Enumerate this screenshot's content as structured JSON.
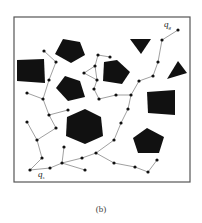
{
  "figure": {
    "caption": "(b)",
    "frame": {
      "x": 14,
      "y": 17,
      "w": 176,
      "h": 165,
      "stroke": "#555555"
    },
    "colors": {
      "obstacle": "#111111",
      "edge": "#777777",
      "node": "#111111",
      "background": "#ffffff"
    },
    "labels": {
      "start": {
        "text": "q",
        "sub": "s",
        "x": 38,
        "y": 177
      },
      "goal": {
        "text": "q",
        "sub": "g",
        "x": 164,
        "y": 27
      }
    },
    "obstacles": [
      {
        "name": "pentagon-top-left",
        "points": "63,39 80,42 85,55 71,63 55,54"
      },
      {
        "name": "square-left",
        "points": "17,60 44,59 45,83 17,81"
      },
      {
        "name": "pentagon-mid-left",
        "points": "65,76 80,81 85,97 68,101 56,88"
      },
      {
        "name": "pentagon-center",
        "points": "104,62 117,60 130,72 122,84 103,81"
      },
      {
        "name": "triangle-top-right",
        "points": "130,39 151,39 141,54"
      },
      {
        "name": "triangle-right",
        "points": "178,61 187,73 167,79"
      },
      {
        "name": "square-right",
        "points": "147,92 175,90 175,115 148,113"
      },
      {
        "name": "hexagon-center",
        "points": "85,109 101,117 103,136 85,144 66,136 67,117"
      },
      {
        "name": "pentagon-bottom-right",
        "points": "147,128 164,137 159,153 138,153 133,138"
      }
    ],
    "nodes": [
      {
        "id": "qs",
        "x": 30,
        "y": 170
      },
      {
        "id": "n1",
        "x": 50,
        "y": 168
      },
      {
        "id": "n2",
        "x": 62,
        "y": 163
      },
      {
        "id": "n3",
        "x": 64,
        "y": 147
      },
      {
        "id": "n4",
        "x": 85,
        "y": 170
      },
      {
        "id": "n5",
        "x": 82,
        "y": 158
      },
      {
        "id": "n6",
        "x": 96,
        "y": 153
      },
      {
        "id": "n7",
        "x": 114,
        "y": 163
      },
      {
        "id": "n8",
        "x": 135,
        "y": 167
      },
      {
        "id": "n9",
        "x": 148,
        "y": 172
      },
      {
        "id": "n10",
        "x": 157,
        "y": 160
      },
      {
        "id": "n11",
        "x": 114,
        "y": 140
      },
      {
        "id": "n12",
        "x": 121,
        "y": 123
      },
      {
        "id": "n13",
        "x": 128,
        "y": 109
      },
      {
        "id": "n14",
        "x": 131,
        "y": 95
      },
      {
        "id": "n15",
        "x": 116,
        "y": 95
      },
      {
        "id": "n16",
        "x": 99,
        "y": 99
      },
      {
        "id": "n17",
        "x": 94,
        "y": 89
      },
      {
        "id": "n18",
        "x": 97,
        "y": 80
      },
      {
        "id": "n19",
        "x": 84,
        "y": 73
      },
      {
        "id": "n20",
        "x": 95,
        "y": 66
      },
      {
        "id": "n21",
        "x": 98,
        "y": 55
      },
      {
        "id": "n22",
        "x": 110,
        "y": 57
      },
      {
        "id": "n23",
        "x": 139,
        "y": 81
      },
      {
        "id": "n24",
        "x": 153,
        "y": 76
      },
      {
        "id": "n25",
        "x": 158,
        "y": 62
      },
      {
        "id": "n26",
        "x": 162,
        "y": 40
      },
      {
        "id": "qg",
        "x": 178,
        "y": 30
      },
      {
        "id": "n27",
        "x": 42,
        "y": 158
      },
      {
        "id": "n28",
        "x": 37,
        "y": 140
      },
      {
        "id": "n29",
        "x": 27,
        "y": 122
      },
      {
        "id": "n30",
        "x": 56,
        "y": 128
      },
      {
        "id": "n31",
        "x": 49,
        "y": 115
      },
      {
        "id": "n32",
        "x": 68,
        "y": 110
      },
      {
        "id": "n33",
        "x": 43,
        "y": 99
      },
      {
        "id": "n34",
        "x": 27,
        "y": 93
      },
      {
        "id": "n35",
        "x": 49,
        "y": 80
      },
      {
        "id": "n36",
        "x": 56,
        "y": 62
      },
      {
        "id": "n37",
        "x": 44,
        "y": 51
      }
    ],
    "edges": [
      [
        "qs",
        "n1"
      ],
      [
        "n1",
        "n2"
      ],
      [
        "n2",
        "n3"
      ],
      [
        "n2",
        "n4"
      ],
      [
        "n2",
        "n5"
      ],
      [
        "n5",
        "n6"
      ],
      [
        "n6",
        "n7"
      ],
      [
        "n7",
        "n8"
      ],
      [
        "n8",
        "n9"
      ],
      [
        "n9",
        "n10"
      ],
      [
        "n6",
        "n11"
      ],
      [
        "n11",
        "n12"
      ],
      [
        "n12",
        "n13"
      ],
      [
        "n13",
        "n14"
      ],
      [
        "n14",
        "n15"
      ],
      [
        "n15",
        "n16"
      ],
      [
        "n16",
        "n17"
      ],
      [
        "n17",
        "n18"
      ],
      [
        "n18",
        "n19"
      ],
      [
        "n19",
        "n20"
      ],
      [
        "n18",
        "n20"
      ],
      [
        "n20",
        "n21"
      ],
      [
        "n21",
        "n22"
      ],
      [
        "n14",
        "n23"
      ],
      [
        "n23",
        "n24"
      ],
      [
        "n24",
        "n25"
      ],
      [
        "n25",
        "n26"
      ],
      [
        "n26",
        "qg"
      ],
      [
        "qs",
        "n27"
      ],
      [
        "n27",
        "n28"
      ],
      [
        "n28",
        "n29"
      ],
      [
        "n28",
        "n30"
      ],
      [
        "n30",
        "n31"
      ],
      [
        "n31",
        "n32"
      ],
      [
        "n31",
        "n33"
      ],
      [
        "n33",
        "n34"
      ],
      [
        "n33",
        "n35"
      ],
      [
        "n35",
        "n36"
      ],
      [
        "n36",
        "n37"
      ]
    ]
  }
}
